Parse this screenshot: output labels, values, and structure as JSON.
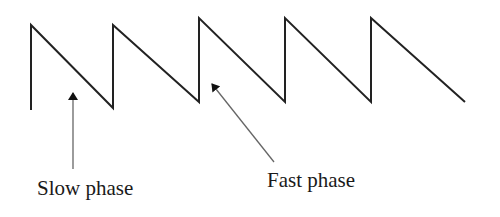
{
  "diagram": {
    "type": "sawtooth-waveform",
    "waveform": {
      "stroke_color": "#222222",
      "stroke_width": 2,
      "points": [
        [
          31,
          110
        ],
        [
          31,
          25
        ],
        [
          113,
          108
        ],
        [
          113,
          25
        ],
        [
          199,
          102
        ],
        [
          199,
          18
        ],
        [
          285,
          102
        ],
        [
          285,
          18
        ],
        [
          371,
          102
        ],
        [
          371,
          18
        ],
        [
          465,
          102
        ]
      ]
    },
    "annotations": [
      {
        "id": "slow-phase",
        "label": "Slow phase",
        "arrow": {
          "from": [
            73,
            169
          ],
          "to": [
            73,
            93
          ]
        },
        "text_position": [
          37,
          195
        ]
      },
      {
        "id": "fast-phase",
        "label": "Fast phase",
        "arrow": {
          "from": [
            274,
            162
          ],
          "to": [
            212,
            84
          ]
        },
        "text_position": [
          267,
          187
        ]
      }
    ],
    "arrow_color": "#666666"
  }
}
